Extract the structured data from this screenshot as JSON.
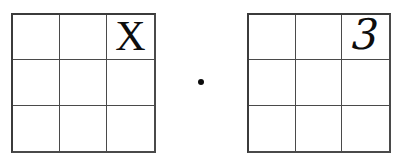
{
  "canvas": {
    "width": 403,
    "height": 160,
    "background_color": "#ffffff",
    "line_color": "#3b3b3b",
    "text_color": "#0d0d0d"
  },
  "expression": {
    "operator_symbol": "·",
    "operator_name": "multiplication-dot",
    "description": "left 3x3 grid times right 3x3 grid"
  },
  "grids": [
    {
      "id": "left-grid",
      "rows": 3,
      "columns": 3,
      "cells": [
        [
          "",
          "",
          ""
        ],
        [
          "",
          "",
          ""
        ],
        [
          "",
          "",
          ""
        ]
      ],
      "filled": {
        "row": 1,
        "column": 3,
        "value": "X"
      }
    },
    {
      "id": "right-grid",
      "rows": 3,
      "columns": 3,
      "cells": [
        [
          "",
          "",
          ""
        ],
        [
          "",
          "",
          ""
        ],
        [
          "",
          "",
          ""
        ]
      ],
      "filled": {
        "row": 1,
        "column": 3,
        "value": "3"
      }
    }
  ],
  "left_grid": {
    "r1c1": "",
    "r1c2": "",
    "r1c3": "X",
    "r2c1": "",
    "r2c2": "",
    "r2c3": "",
    "r3c1": "",
    "r3c2": "",
    "r3c3": ""
  },
  "right_grid": {
    "r1c1": "",
    "r1c2": "",
    "r1c3": "3",
    "r2c1": "",
    "r2c2": "",
    "r2c3": "",
    "r3c1": "",
    "r3c2": "",
    "r3c3": ""
  }
}
